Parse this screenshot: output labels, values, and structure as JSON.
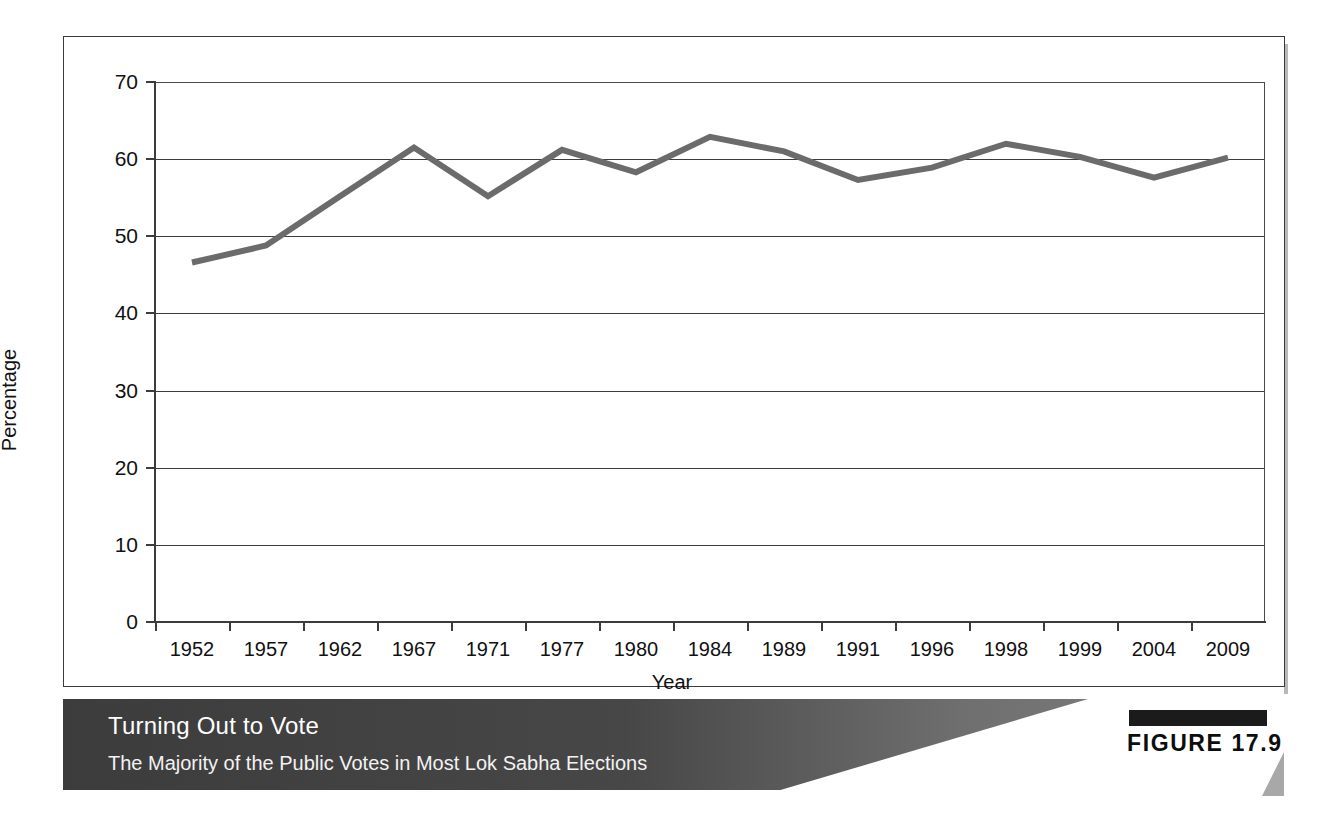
{
  "figure": {
    "tag_label": "FIGURE 17.9",
    "caption_title": "Turning Out to Vote",
    "caption_subtitle": "The Majority of the Public Votes in Most Lok Sabha Elections"
  },
  "chart_data": {
    "type": "line",
    "title": "Turning Out to Vote",
    "subtitle": "The Majority of the Public Votes in Most Lok Sabha Elections",
    "xlabel": "Year",
    "ylabel": "Percentage",
    "ylim": [
      0,
      70
    ],
    "yticks": [
      "0",
      "10",
      "20",
      "30",
      "40",
      "50",
      "60",
      "70"
    ],
    "ytick_values": [
      0,
      10,
      20,
      30,
      40,
      50,
      60,
      70
    ],
    "grid": "horizontal",
    "legend": "none",
    "line_color": "#6b6b6b",
    "categories": [
      "1952",
      "1957",
      "1962",
      "1967",
      "1971",
      "1977",
      "1980",
      "1984",
      "1989",
      "1991",
      "1996",
      "1998",
      "1999",
      "2004",
      "2009"
    ],
    "values": [
      46.6,
      48.8,
      55.2,
      61.5,
      55.2,
      61.2,
      58.3,
      62.9,
      61.0,
      57.3,
      58.9,
      62.0,
      60.3,
      57.6,
      60.2
    ],
    "series": [
      {
        "name": "Voter turnout",
        "values": [
          46.6,
          48.8,
          55.2,
          61.5,
          55.2,
          61.2,
          58.3,
          62.9,
          61.0,
          57.3,
          58.9,
          62.0,
          60.3,
          57.6,
          60.2
        ]
      }
    ]
  }
}
